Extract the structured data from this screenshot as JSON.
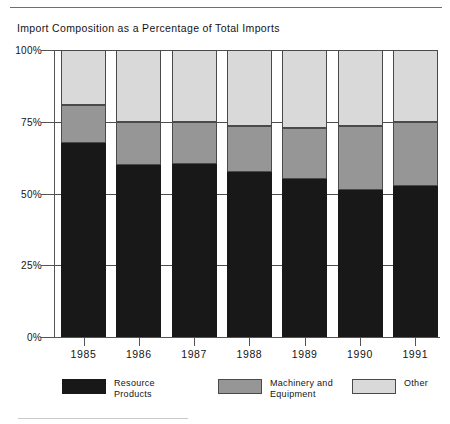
{
  "chart_title": "Import Composition as a Percentage of Total Imports",
  "axis": {
    "y_ticks": [
      "100%",
      "75%",
      "50%",
      "25%",
      "0%"
    ],
    "x_ticks": [
      "1985",
      "1986",
      "1987",
      "1988",
      "1989",
      "1990",
      "1991"
    ]
  },
  "legend": {
    "items": [
      {
        "label": "Resource\nProducts",
        "swatch_name": "legend-swatch-resource-products",
        "color": "#181818"
      },
      {
        "label": "Machinery and\nEquipment",
        "swatch_name": "legend-swatch-machinery-equipment",
        "color": "#969696"
      },
      {
        "label": "Other",
        "swatch_name": "legend-swatch-other",
        "color": "#d9d9d9"
      }
    ]
  },
  "chart_data": {
    "type": "bar",
    "subtype": "stacked-percentage",
    "title": "Import Composition as a Percentage of Total Imports",
    "xlabel": "",
    "ylabel": "",
    "ylim": [
      0,
      100
    ],
    "ytick_values": [
      0,
      25,
      50,
      75,
      100
    ],
    "ytick_labels": [
      "0%",
      "25%",
      "50%",
      "75%",
      "100%"
    ],
    "grid": true,
    "grid_axis": "y",
    "legend_position": "bottom",
    "categories": [
      "1985",
      "1986",
      "1987",
      "1988",
      "1989",
      "1990",
      "1991"
    ],
    "series": [
      {
        "name": "Resource Products",
        "color": "#181818",
        "values": [
          67.6,
          60.0,
          60.3,
          57.5,
          55.1,
          51.2,
          52.6
        ]
      },
      {
        "name": "Machinery and Equipment",
        "color": "#969696",
        "values": [
          13.2,
          15.0,
          14.6,
          16.0,
          17.7,
          22.3,
          22.4
        ]
      },
      {
        "name": "Other",
        "color": "#d9d9d9",
        "values": [
          19.2,
          25.0,
          25.1,
          26.5,
          27.2,
          26.5,
          25.0
        ]
      }
    ]
  }
}
